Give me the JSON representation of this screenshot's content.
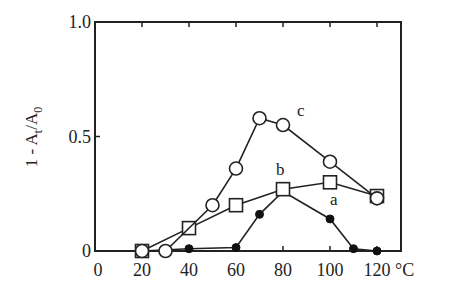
{
  "chart_data": {
    "type": "line",
    "title": "",
    "xlabel": "°C",
    "ylabel": "1 - A_t/A_0",
    "ylabel_parts": {
      "main": "1 - A",
      "sub1": "t",
      "mid": "/A",
      "sub2": "0"
    },
    "xlim": [
      0,
      130
    ],
    "ylim": [
      0,
      1.0
    ],
    "x_ticks": [
      0,
      20,
      40,
      60,
      80,
      100,
      120
    ],
    "x_tick_labels": [
      "0",
      "20",
      "40",
      "60",
      "80",
      "100",
      "120"
    ],
    "x_unit_label": "°C",
    "y_ticks": [
      0,
      0.5,
      1.0
    ],
    "y_tick_labels": [
      "0",
      "0.5",
      "1.0"
    ],
    "grid": false,
    "legend": "inline labels",
    "series": [
      {
        "name": "a",
        "marker": "filled-circle",
        "x": [
          20,
          40,
          60,
          70,
          80,
          100,
          110,
          120
        ],
        "values": [
          0.0,
          0.01,
          0.015,
          0.16,
          0.26,
          0.14,
          0.01,
          0.0
        ],
        "label_pos": [
          100,
          0.2
        ]
      },
      {
        "name": "b",
        "marker": "open-square",
        "x": [
          20,
          40,
          60,
          80,
          100,
          120
        ],
        "values": [
          0.0,
          0.1,
          0.2,
          0.27,
          0.3,
          0.24
        ],
        "label_pos": [
          77,
          0.33
        ]
      },
      {
        "name": "c",
        "marker": "open-circle",
        "x": [
          20,
          30,
          50,
          60,
          70,
          80,
          100,
          120
        ],
        "values": [
          0.0,
          0.0,
          0.2,
          0.36,
          0.58,
          0.55,
          0.39,
          0.23
        ],
        "label_pos": [
          86,
          0.59
        ]
      }
    ]
  }
}
